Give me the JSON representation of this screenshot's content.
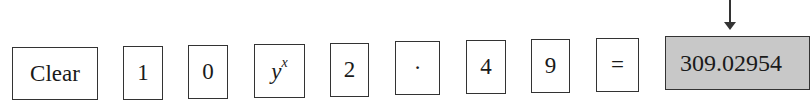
{
  "keys": [
    {
      "label": "Clear"
    },
    {
      "label": "1"
    },
    {
      "label": "0"
    },
    {
      "base": "y",
      "exp": "x"
    },
    {
      "label": "2"
    },
    {
      "label": "·"
    },
    {
      "label": "4"
    },
    {
      "label": "9"
    },
    {
      "label": "="
    }
  ],
  "display": {
    "value": "309.02954"
  },
  "colors": {
    "display_bg": "#c8c8c8",
    "border": "#333333"
  }
}
